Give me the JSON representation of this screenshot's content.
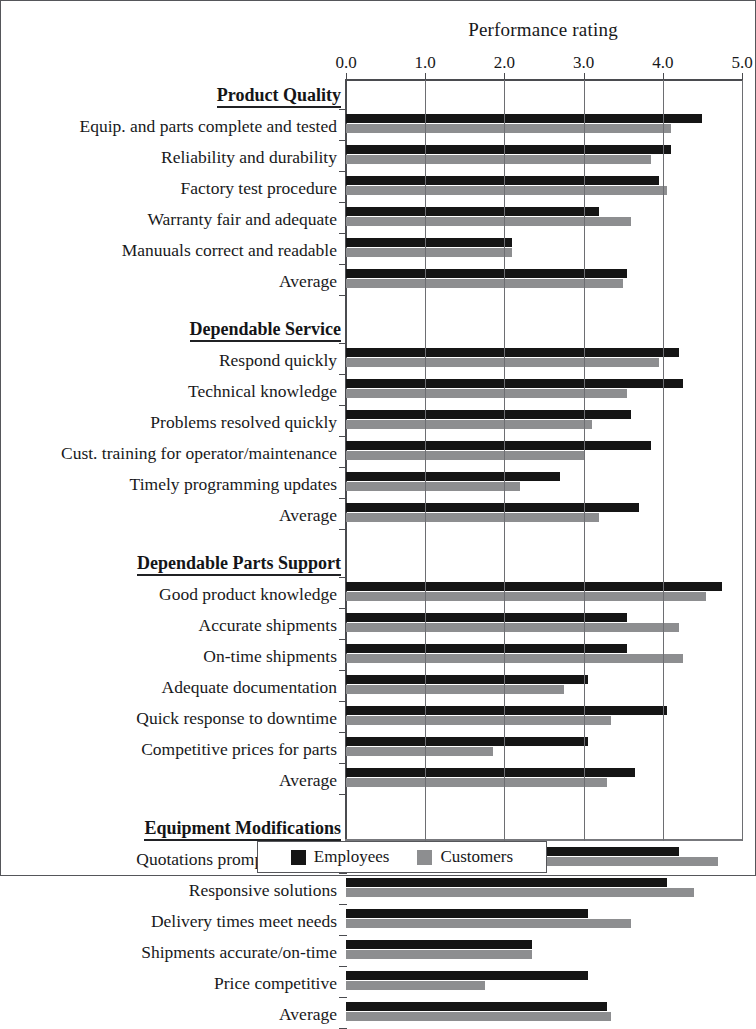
{
  "chart_data": {
    "type": "bar",
    "orientation": "horizontal",
    "title": "Performance rating",
    "xlabel": "",
    "ylabel": "",
    "xlim": [
      0.0,
      5.0
    ],
    "xticks": [
      "0.0",
      "1.0",
      "2.0",
      "3.0",
      "4.0",
      "5.0"
    ],
    "xtick_values": [
      0.0,
      1.0,
      2.0,
      3.0,
      4.0,
      5.0
    ],
    "grid": true,
    "legend_position": "bottom",
    "series": [
      {
        "name": "Employees",
        "color": "#151515"
      },
      {
        "name": "Customers",
        "color": "#8d8e90"
      }
    ],
    "sections": [
      {
        "header": "Product Quality",
        "rows": [
          {
            "label": "Equip. and parts complete and tested",
            "employees": 4.5,
            "customers": 4.1
          },
          {
            "label": "Reliability and durability",
            "employees": 4.1,
            "customers": 3.85
          },
          {
            "label": "Factory test procedure",
            "employees": 3.95,
            "customers": 4.05
          },
          {
            "label": "Warranty fair and adequate",
            "employees": 3.2,
            "customers": 3.6
          },
          {
            "label": "Manuuals correct and readable",
            "employees": 2.1,
            "customers": 2.1
          },
          {
            "label": "Average",
            "employees": 3.55,
            "customers": 3.5
          }
        ]
      },
      {
        "header": "Dependable Service",
        "rows": [
          {
            "label": "Respond quickly",
            "employees": 4.2,
            "customers": 3.95
          },
          {
            "label": "Technical knowledge",
            "employees": 4.25,
            "customers": 3.55
          },
          {
            "label": "Problems resolved quickly",
            "employees": 3.6,
            "customers": 3.1
          },
          {
            "label": "Cust. training for operator/maintenance",
            "employees": 3.85,
            "customers": 3.0
          },
          {
            "label": "Timely programming updates",
            "employees": 2.7,
            "customers": 2.2
          },
          {
            "label": "Average",
            "employees": 3.7,
            "customers": 3.2
          }
        ]
      },
      {
        "header": "Dependable Parts Support",
        "rows": [
          {
            "label": "Good product knowledge",
            "employees": 4.75,
            "customers": 4.55
          },
          {
            "label": "Accurate shipments",
            "employees": 3.55,
            "customers": 4.2
          },
          {
            "label": "On-time shipments",
            "employees": 3.55,
            "customers": 4.25
          },
          {
            "label": "Adequate documentation",
            "employees": 3.05,
            "customers": 2.75
          },
          {
            "label": "Quick response to downtime",
            "employees": 4.05,
            "customers": 3.35
          },
          {
            "label": "Competitive prices for parts",
            "employees": 3.05,
            "customers": 1.85
          },
          {
            "label": "Average",
            "employees": 3.65,
            "customers": 3.3
          }
        ]
      },
      {
        "header": "Equipment Modifications",
        "rows": [
          {
            "label": "Quotations prompt/complete",
            "employees": 4.2,
            "customers": 4.7
          },
          {
            "label": "Responsive solutions",
            "employees": 4.05,
            "customers": 4.4
          },
          {
            "label": "Delivery times meet needs",
            "employees": 3.05,
            "customers": 3.6
          },
          {
            "label": "Shipments accurate/on-time",
            "employees": 2.35,
            "customers": 2.35
          },
          {
            "label": "Price competitive",
            "employees": 3.05,
            "customers": 1.75
          },
          {
            "label": "Average",
            "employees": 3.3,
            "customers": 3.35
          }
        ]
      }
    ]
  },
  "legend": {
    "employees_label": "Employees",
    "customers_label": "Customers"
  }
}
